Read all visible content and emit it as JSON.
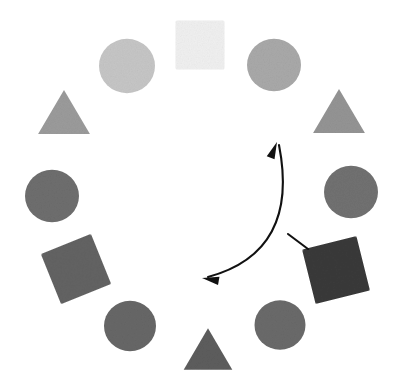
{
  "scene": {
    "title": "Circular arrangement of shapes with curved double-headed arrow",
    "background_color": "#ffffff",
    "width": 403,
    "height": 388,
    "center": {
      "x": 201,
      "y": 195
    },
    "ring_radius": 145
  },
  "shapes": [
    {
      "id": "shape-top-square",
      "name": "square-top",
      "type": "square",
      "position_label": "top (12 o'clock)",
      "cx": 200,
      "cy": 45,
      "size": 49,
      "rotation_deg": 0,
      "color": "#f0f0f0",
      "shade_label": "very light gray"
    },
    {
      "id": "shape-upper-left-circle",
      "name": "circle-upper-left",
      "type": "circle",
      "position_label": "upper left (11 o'clock)",
      "cx": 127,
      "cy": 66,
      "size": 56,
      "rotation_deg": 0,
      "color": "#c6c6c6",
      "shade_label": "light gray"
    },
    {
      "id": "shape-upper-right-circle",
      "name": "circle-upper-right",
      "type": "circle",
      "position_label": "upper right (1 o'clock)",
      "cx": 274,
      "cy": 65,
      "size": 54,
      "rotation_deg": 0,
      "color": "#a9a9a9",
      "shade_label": "medium gray"
    },
    {
      "id": "shape-left-triangle",
      "name": "triangle-upper-left",
      "type": "triangle",
      "position_label": "left upper (10 o'clock)",
      "cx": 64,
      "cy": 112,
      "size": 48,
      "rotation_deg": 0,
      "color": "#9b9b9b",
      "shade_label": "medium gray"
    },
    {
      "id": "shape-right-triangle",
      "name": "triangle-upper-right",
      "type": "triangle",
      "position_label": "right upper (2 o'clock)",
      "cx": 339,
      "cy": 111,
      "size": 48,
      "rotation_deg": 0,
      "color": "#949494",
      "shade_label": "medium gray"
    },
    {
      "id": "shape-left-circle",
      "name": "circle-left",
      "type": "circle",
      "position_label": "left (9 o'clock)",
      "cx": 52,
      "cy": 196,
      "size": 54,
      "rotation_deg": 0,
      "color": "#6e6e6e",
      "shade_label": "dark gray"
    },
    {
      "id": "shape-right-circle",
      "name": "circle-right",
      "type": "circle",
      "position_label": "right (3 o'clock)",
      "cx": 351,
      "cy": 192,
      "size": 54,
      "rotation_deg": 0,
      "color": "#717171",
      "shade_label": "dark gray"
    },
    {
      "id": "shape-left-square",
      "name": "square-lower-left",
      "type": "square",
      "position_label": "lower left (8 o'clock)",
      "cx": 76,
      "cy": 269,
      "size": 54,
      "rotation_deg": -22,
      "color": "#636363",
      "shade_label": "dark gray"
    },
    {
      "id": "shape-right-square",
      "name": "square-lower-right",
      "type": "square",
      "position_label": "lower right (4 o'clock)",
      "cx": 336,
      "cy": 270,
      "size": 56,
      "rotation_deg": -14,
      "color": "#3a3a3a",
      "shade_label": "very dark gray"
    },
    {
      "id": "shape-bottom-left-circle",
      "name": "circle-lower-left",
      "type": "circle",
      "position_label": "bottom left (7 o'clock)",
      "cx": 130,
      "cy": 326,
      "size": 52,
      "rotation_deg": 0,
      "color": "#676767",
      "shade_label": "dark gray"
    },
    {
      "id": "shape-bottom-right-circle",
      "name": "circle-lower-right",
      "type": "circle",
      "position_label": "bottom right (5 o'clock)",
      "cx": 280,
      "cy": 325,
      "size": 51,
      "rotation_deg": 0,
      "color": "#6a6a6a",
      "shade_label": "dark gray"
    },
    {
      "id": "shape-bottom-triangle",
      "name": "triangle-bottom",
      "type": "triangle",
      "position_label": "bottom (6 o'clock)",
      "cx": 208,
      "cy": 349,
      "size": 45,
      "rotation_deg": 0,
      "color": "#5d5d5d",
      "shade_label": "dark gray"
    }
  ],
  "annotation": {
    "arrow": {
      "name": "curved-double-arrow",
      "color": "#111111",
      "stroke_width": 2.1,
      "style": "double-headed curved arc",
      "start_point": {
        "x": 279,
        "y": 145
      },
      "control_point": {
        "x": 300,
        "y": 252
      },
      "end_point": {
        "x": 208,
        "y": 277
      },
      "head_start_label": "arrowhead pointing up-right",
      "head_end_label": "arrowhead pointing left"
    },
    "tick": {
      "name": "arc-tick-mark",
      "color": "#111111",
      "stroke_width": 2.1,
      "x1": 288,
      "y1": 234,
      "x2": 308,
      "y2": 249
    }
  }
}
